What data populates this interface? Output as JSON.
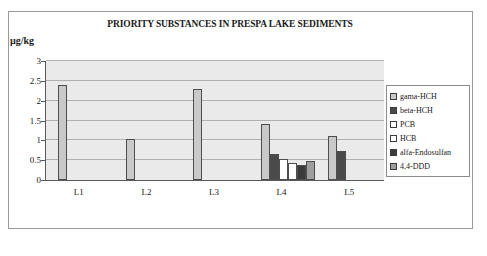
{
  "chart_data": {
    "type": "bar",
    "title": "PRIORITY SUBSTANCES IN PRESPA LAKE SEDIMENTS",
    "xlabel": "",
    "ylabel": "µg/kg",
    "categories": [
      "L1",
      "L2",
      "L3",
      "L4",
      "L5"
    ],
    "ylim": [
      0,
      3
    ],
    "yticks": [
      "0",
      "0.5",
      "1",
      "1.5",
      "2",
      "2.5",
      "3"
    ],
    "ytick_values": [
      0,
      0.5,
      1,
      1.5,
      2,
      2.5,
      3
    ],
    "grid": true,
    "legend_position": "right",
    "series": [
      {
        "name": "gama-HCH",
        "color": "#c9c9c9",
        "values": [
          2.4,
          1.03,
          2.3,
          1.4,
          1.1
        ]
      },
      {
        "name": "beta-HCH",
        "color": "#4a4a4a",
        "values": [
          null,
          null,
          null,
          0.65,
          0.72
        ]
      },
      {
        "name": "PCB",
        "color": "#ffffff",
        "values": [
          null,
          null,
          null,
          0.53,
          null
        ]
      },
      {
        "name": "HCB",
        "color": "#fdfdfd",
        "values": [
          null,
          null,
          null,
          0.42,
          null
        ]
      },
      {
        "name": "alfa-Endosulfan",
        "color": "#3a3a3a",
        "values": [
          null,
          null,
          null,
          0.38,
          null
        ]
      },
      {
        "name": "4,4-DDD",
        "color": "#9e9e9e",
        "values": [
          null,
          null,
          null,
          0.48,
          null
        ]
      }
    ]
  },
  "legend": {
    "items": [
      {
        "label": "gama-HCH",
        "color": "#c9c9c9"
      },
      {
        "label": "beta-HCH",
        "color": "#4a4a4a"
      },
      {
        "label": "PCB",
        "color": "#ffffff"
      },
      {
        "label": "HCB",
        "color": "#fdfdfd"
      },
      {
        "label": "alfa-Endosulfan",
        "color": "#3a3a3a"
      },
      {
        "label": "4,4-DDD",
        "color": "#9e9e9e"
      }
    ]
  }
}
